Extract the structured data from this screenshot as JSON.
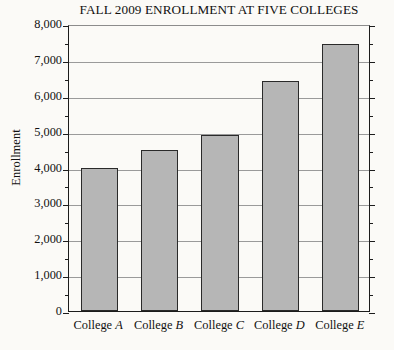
{
  "chart_data": {
    "type": "bar",
    "title": "FALL 2009 ENROLLMENT AT FIVE COLLEGES",
    "xlabel": "",
    "ylabel": "Enrollment",
    "categories": [
      "College A",
      "College B",
      "College C",
      "College D",
      "College E"
    ],
    "category_names": [
      "College",
      "College",
      "College",
      "College",
      "College"
    ],
    "category_letters": [
      "A",
      "B",
      "C",
      "D",
      "E"
    ],
    "values": [
      4000,
      4500,
      4900,
      6400,
      7450
    ],
    "ylim": [
      0,
      8000
    ],
    "y_major_step": 1000,
    "y_minor_step": 500,
    "grid": "horizontal-major",
    "legend": "none",
    "y_tick_labels": [
      "0",
      "1,000",
      "2,000",
      "3,000",
      "4,000",
      "5,000",
      "6,000",
      "7,000",
      "8,000"
    ],
    "y_tick_values": [
      0,
      1000,
      2000,
      3000,
      4000,
      5000,
      6000,
      7000,
      8000
    ],
    "y_minor_tick_values": [
      500,
      1500,
      2500,
      3500,
      4500,
      5500,
      6500,
      7500
    ],
    "bar_color": "#b6b6b6",
    "bar_edge_color": "#2a2a2a",
    "axis_color": "#1c1c1c",
    "grid_color": "#9a9a9a",
    "background_color": "#fbfaf7"
  }
}
